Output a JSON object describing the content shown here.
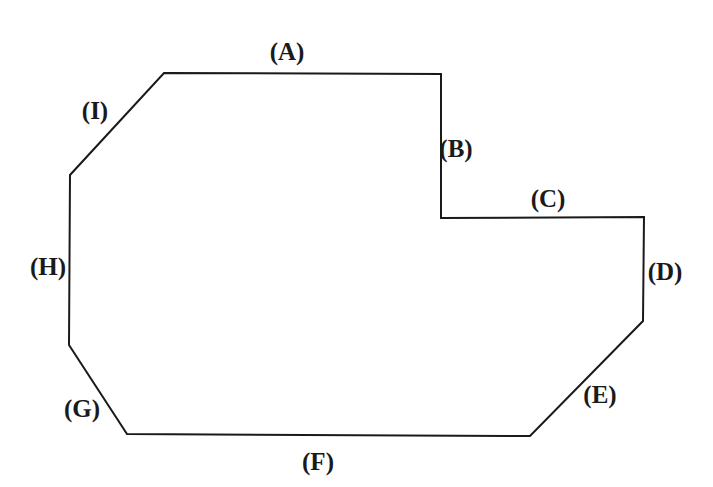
{
  "figure": {
    "type": "polygon-diagram",
    "width": 713,
    "height": 487,
    "background_color": "#ffffff",
    "stroke_color": "#1a1a1a",
    "stroke_width": 2,
    "fill": "none",
    "vertices": [
      {
        "x": 164,
        "y": 73
      },
      {
        "x": 441,
        "y": 74
      },
      {
        "x": 441,
        "y": 218
      },
      {
        "x": 644,
        "y": 217
      },
      {
        "x": 643,
        "y": 321
      },
      {
        "x": 530,
        "y": 436
      },
      {
        "x": 127,
        "y": 434
      },
      {
        "x": 69,
        "y": 345
      },
      {
        "x": 70,
        "y": 175
      }
    ],
    "labels": [
      {
        "id": "label-a",
        "text": "(A)",
        "x": 287,
        "y": 51
      },
      {
        "id": "label-b",
        "text": "(B)",
        "x": 456,
        "y": 148
      },
      {
        "id": "label-c",
        "text": "(C)",
        "x": 548,
        "y": 198
      },
      {
        "id": "label-d",
        "text": "(D)",
        "x": 665,
        "y": 271
      },
      {
        "id": "label-e",
        "text": "(E)",
        "x": 600,
        "y": 394
      },
      {
        "id": "label-f",
        "text": "(F)",
        "x": 318,
        "y": 461
      },
      {
        "id": "label-g",
        "text": "(G)",
        "x": 82,
        "y": 408
      },
      {
        "id": "label-h",
        "text": "(H)",
        "x": 48,
        "y": 266
      },
      {
        "id": "label-i",
        "text": "(I)",
        "x": 95,
        "y": 110
      }
    ]
  }
}
